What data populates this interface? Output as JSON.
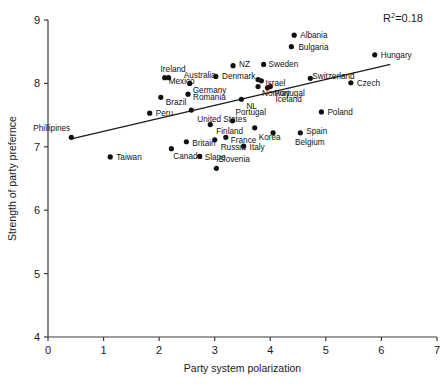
{
  "chart_data": {
    "type": "scatter",
    "title": "",
    "xlabel": "Party system polarization",
    "ylabel": "Strength of party prefernce",
    "xlim": [
      0,
      7
    ],
    "ylim": [
      4,
      9
    ],
    "xticks": [
      "0",
      "1",
      "2",
      "3",
      "4",
      "5",
      "6",
      "7"
    ],
    "yticks": [
      "4",
      "5",
      "6",
      "7",
      "8",
      "9"
    ],
    "grid": false,
    "legend": "none",
    "annotations": {
      "r2_prefix": "R",
      "r2_exponent": "2",
      "r2_value": "=0.18"
    },
    "trendline": {
      "x_start": 0.4,
      "y_start": 7.12,
      "x_end": 6.16,
      "y_end": 8.3
    },
    "points": [
      {
        "label": "Phillipines",
        "x": 0.42,
        "y": 7.15,
        "label_dx": -38,
        "label_dy": -6
      },
      {
        "label": "Taiwan",
        "x": 1.12,
        "y": 6.84,
        "label_dx": 6,
        "label_dy": 3
      },
      {
        "label": "Peru",
        "x": 1.83,
        "y": 7.53,
        "label_dx": 6,
        "label_dy": 3
      },
      {
        "label": "Brazil",
        "x": 2.03,
        "y": 7.78,
        "label_dx": 5,
        "label_dy": 8
      },
      {
        "label": "Mexico",
        "x": 2.1,
        "y": 8.09,
        "label_dx": 4,
        "label_dy": 6
      },
      {
        "label": "Ireland",
        "x": 2.17,
        "y": 8.09,
        "label_dx": -8,
        "label_dy": -6
      },
      {
        "label": "Canada",
        "x": 2.22,
        "y": 6.97,
        "label_dx": 2,
        "label_dy": 10
      },
      {
        "label": "Britain",
        "x": 2.49,
        "y": 7.08,
        "label_dx": 6,
        "label_dy": 4
      },
      {
        "label": "Romania",
        "x": 2.52,
        "y": 7.83,
        "label_dx": 5,
        "label_dy": 6
      },
      {
        "label": "Germany",
        "x": 2.55,
        "y": 8.0,
        "label_dx": 3,
        "label_dy": 10
      },
      {
        "label": "Slape",
        "x": 2.73,
        "y": 6.85,
        "label_dx": 5,
        "label_dy": 4
      },
      {
        "label": "United States",
        "x": 2.58,
        "y": 7.58,
        "label_dx": 6,
        "label_dy": 12
      },
      {
        "label": "Australia",
        "x": 3.02,
        "y": 8.11,
        "label_dx": -32,
        "label_dy": 2
      },
      {
        "label": "Finland",
        "x": 2.92,
        "y": 7.35,
        "label_dx": 6,
        "label_dy": 9
      },
      {
        "label": "Russia",
        "x": 3.0,
        "y": 7.11,
        "label_dx": 6,
        "label_dy": 10
      },
      {
        "label": "Slovenia",
        "x": 3.03,
        "y": 6.66,
        "label_dx": 2,
        "label_dy": -6
      },
      {
        "label": "France",
        "x": 3.2,
        "y": 7.15,
        "label_dx": 5,
        "label_dy": 6
      },
      {
        "label": "NZ",
        "x": 3.33,
        "y": 8.28,
        "label_dx": 6,
        "label_dy": 1
      },
      {
        "label": "NL",
        "x": 3.48,
        "y": 7.75,
        "label_dx": 5,
        "label_dy": 10
      },
      {
        "label": "Portugal",
        "x": 3.32,
        "y": 7.41,
        "label_dx": 3,
        "label_dy": -6
      },
      {
        "label": "Italy",
        "x": 3.52,
        "y": 7.01,
        "label_dx": 6,
        "label_dy": 4
      },
      {
        "label": "Denmark",
        "x": 3.78,
        "y": 8.06,
        "label_dx": -36,
        "label_dy": -1
      },
      {
        "label": "Sweden",
        "x": 3.88,
        "y": 8.3,
        "label_dx": 5,
        "label_dy": 3
      },
      {
        "label": "Israel",
        "x": 3.84,
        "y": 8.04,
        "label_dx": 4,
        "label_dy": 5
      },
      {
        "label": "Norway",
        "x": 3.78,
        "y": 7.95,
        "label_dx": 4,
        "label_dy": 9
      },
      {
        "label": "Portugal2",
        "x": 4.0,
        "y": 7.95,
        "label_dx": 4,
        "label_dy": 9
      },
      {
        "label": "Iceland",
        "x": 3.95,
        "y": 7.93,
        "label_dx": 8,
        "label_dy": 14
      },
      {
        "label": "Korea",
        "x": 3.72,
        "y": 7.3,
        "label_dx": 4,
        "label_dy": 12
      },
      {
        "label": "Belgium",
        "x": 4.05,
        "y": 7.22,
        "label_dx": 22,
        "label_dy": 12
      },
      {
        "label": "Albania",
        "x": 4.43,
        "y": 8.76,
        "label_dx": 6,
        "label_dy": 3
      },
      {
        "label": "Bulgaria",
        "x": 4.38,
        "y": 8.58,
        "label_dx": 7,
        "label_dy": 3
      },
      {
        "label": "Spain",
        "x": 4.54,
        "y": 7.22,
        "label_dx": 6,
        "label_dy": 1
      },
      {
        "label": "Switzerland",
        "x": 4.72,
        "y": 8.08,
        "label_dx": 2,
        "label_dy": 1
      },
      {
        "label": "Poland",
        "x": 4.92,
        "y": 7.55,
        "label_dx": 6,
        "label_dy": 3
      },
      {
        "label": "Czech",
        "x": 5.45,
        "y": 8.01,
        "label_dx": 6,
        "label_dy": 3
      },
      {
        "label": "Hungary",
        "x": 5.88,
        "y": 8.45,
        "label_dx": 6,
        "label_dy": 3
      }
    ]
  }
}
